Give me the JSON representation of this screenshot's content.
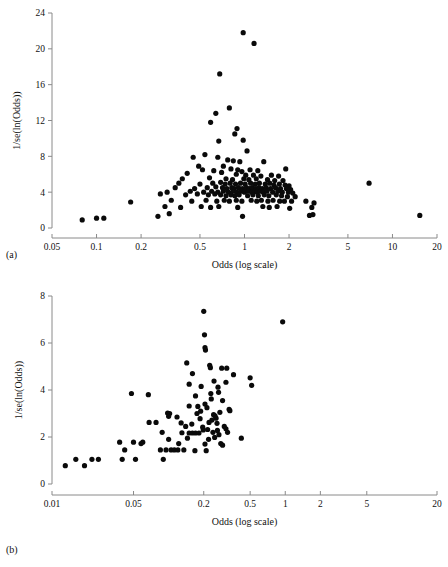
{
  "figure": {
    "panel_a_label": "(a)",
    "panel_b_label": "(b)",
    "point_color": "#0a0a0a",
    "axis_color": "#8a8a8a"
  },
  "chart_data": [
    {
      "type": "scatter",
      "panel": "(a)",
      "title": "",
      "xlabel": "Odds (log scale)",
      "ylabel": "1/se(ln(Odds))",
      "xscale": "log",
      "xlim": [
        0.05,
        20
      ],
      "ylim": [
        0,
        24
      ],
      "xticks": [
        0.05,
        0.1,
        0.2,
        0.5,
        1,
        2,
        5,
        10,
        20
      ],
      "xticklabels": [
        "0.05",
        "0.1",
        "0.2",
        "0.5",
        "1",
        "2",
        "5",
        "10",
        "20"
      ],
      "yticks": [
        0,
        4,
        8,
        12,
        16,
        20,
        24
      ],
      "yticklabels": [
        "0",
        "4",
        "8",
        "12",
        "16",
        "20",
        "24"
      ],
      "grid": false,
      "legend": "none",
      "n_points": 163,
      "points": [
        [
          0.98,
          21.8
        ],
        [
          1.16,
          20.6
        ],
        [
          0.68,
          17.2
        ],
        [
          0.79,
          13.4
        ],
        [
          0.64,
          12.8
        ],
        [
          0.59,
          11.8
        ],
        [
          0.89,
          11.1
        ],
        [
          0.86,
          10.5
        ],
        [
          0.67,
          9.7
        ],
        [
          0.98,
          9.8
        ],
        [
          0.54,
          8.2
        ],
        [
          1.04,
          8.6
        ],
        [
          0.45,
          7.9
        ],
        [
          0.66,
          7.9
        ],
        [
          0.77,
          7.6
        ],
        [
          0.84,
          7.5
        ],
        [
          0.93,
          7.4
        ],
        [
          1.35,
          7.4
        ],
        [
          0.49,
          6.9
        ],
        [
          0.52,
          6.5
        ],
        [
          0.72,
          6.9
        ],
        [
          0.81,
          6.6
        ],
        [
          0.9,
          6.5
        ],
        [
          0.96,
          6.3
        ],
        [
          1.09,
          6.5
        ],
        [
          1.23,
          6.4
        ],
        [
          1.9,
          6.6
        ],
        [
          0.41,
          6.1
        ],
        [
          0.62,
          6.4
        ],
        [
          0.7,
          6.2
        ],
        [
          0.88,
          6.0
        ],
        [
          1.02,
          5.9
        ],
        [
          1.15,
          5.9
        ],
        [
          1.29,
          5.8
        ],
        [
          1.52,
          5.9
        ],
        [
          1.7,
          5.8
        ],
        [
          0.38,
          5.5
        ],
        [
          0.58,
          5.6
        ],
        [
          0.75,
          5.5
        ],
        [
          0.83,
          5.4
        ],
        [
          0.99,
          5.5
        ],
        [
          1.07,
          5.4
        ],
        [
          1.2,
          5.5
        ],
        [
          1.43,
          5.4
        ],
        [
          1.6,
          5.3
        ],
        [
          1.82,
          5.3
        ],
        [
          6.95,
          5.0
        ],
        [
          0.36,
          5.0
        ],
        [
          0.5,
          4.9
        ],
        [
          0.61,
          5.0
        ],
        [
          0.69,
          5.1
        ],
        [
          0.74,
          4.9
        ],
        [
          0.8,
          5.0
        ],
        [
          0.87,
          4.9
        ],
        [
          0.94,
          5.0
        ],
        [
          1.01,
          4.9
        ],
        [
          1.1,
          5.0
        ],
        [
          1.18,
          4.9
        ],
        [
          1.26,
          5.0
        ],
        [
          1.38,
          4.9
        ],
        [
          1.48,
          5.0
        ],
        [
          1.58,
          4.8
        ],
        [
          1.72,
          4.9
        ],
        [
          1.88,
          4.8
        ],
        [
          2.0,
          4.7
        ],
        [
          0.34,
          4.5
        ],
        [
          0.46,
          4.4
        ],
        [
          0.56,
          4.5
        ],
        [
          0.64,
          4.6
        ],
        [
          0.71,
          4.5
        ],
        [
          0.76,
          4.4
        ],
        [
          0.82,
          4.5
        ],
        [
          0.85,
          4.4
        ],
        [
          0.91,
          4.5
        ],
        [
          0.97,
          4.4
        ],
        [
          1.03,
          4.5
        ],
        [
          1.08,
          4.4
        ],
        [
          1.13,
          4.5
        ],
        [
          1.19,
          4.4
        ],
        [
          1.25,
          4.5
        ],
        [
          1.32,
          4.4
        ],
        [
          1.4,
          4.5
        ],
        [
          1.5,
          4.4
        ],
        [
          1.62,
          4.5
        ],
        [
          1.75,
          4.4
        ],
        [
          1.92,
          4.4
        ],
        [
          2.05,
          4.3
        ],
        [
          0.3,
          4.0
        ],
        [
          0.43,
          4.1
        ],
        [
          0.53,
          4.0
        ],
        [
          0.6,
          4.1
        ],
        [
          0.66,
          4.0
        ],
        [
          0.72,
          4.1
        ],
        [
          0.78,
          4.0
        ],
        [
          0.84,
          4.1
        ],
        [
          0.89,
          4.0
        ],
        [
          0.95,
          4.1
        ],
        [
          1.0,
          4.0
        ],
        [
          1.06,
          4.1
        ],
        [
          1.12,
          4.0
        ],
        [
          1.17,
          4.1
        ],
        [
          1.22,
          4.0
        ],
        [
          1.28,
          4.1
        ],
        [
          1.34,
          4.0
        ],
        [
          1.42,
          4.1
        ],
        [
          1.55,
          4.0
        ],
        [
          1.68,
          4.1
        ],
        [
          1.8,
          4.0
        ],
        [
          1.98,
          4.0
        ],
        [
          2.12,
          3.9
        ],
        [
          0.27,
          3.8
        ],
        [
          0.4,
          3.7
        ],
        [
          0.48,
          3.8
        ],
        [
          0.57,
          3.7
        ],
        [
          0.63,
          3.8
        ],
        [
          0.69,
          3.7
        ],
        [
          0.75,
          3.6
        ],
        [
          0.81,
          3.7
        ],
        [
          0.86,
          3.6
        ],
        [
          0.92,
          3.7
        ],
        [
          1.05,
          3.6
        ],
        [
          1.14,
          3.7
        ],
        [
          1.24,
          3.6
        ],
        [
          1.36,
          3.7
        ],
        [
          1.46,
          3.6
        ],
        [
          1.64,
          3.7
        ],
        [
          1.78,
          3.6
        ],
        [
          1.95,
          3.5
        ],
        [
          2.2,
          3.5
        ],
        [
          0.17,
          2.9
        ],
        [
          0.32,
          3.1
        ],
        [
          0.44,
          3.0
        ],
        [
          0.55,
          3.1
        ],
        [
          0.65,
          3.0
        ],
        [
          0.73,
          3.1
        ],
        [
          0.79,
          3.0
        ],
        [
          0.88,
          3.1
        ],
        [
          0.96,
          3.0
        ],
        [
          1.11,
          3.1
        ],
        [
          1.21,
          3.0
        ],
        [
          1.3,
          3.1
        ],
        [
          1.44,
          3.0
        ],
        [
          1.56,
          3.1
        ],
        [
          1.73,
          3.0
        ],
        [
          1.86,
          3.0
        ],
        [
          2.08,
          3.0
        ],
        [
          2.6,
          3.0
        ],
        [
          2.95,
          2.8
        ],
        [
          0.29,
          2.4
        ],
        [
          0.37,
          2.3
        ],
        [
          0.51,
          2.4
        ],
        [
          0.59,
          2.3
        ],
        [
          0.67,
          2.4
        ],
        [
          0.9,
          2.3
        ],
        [
          1.33,
          2.4
        ],
        [
          1.47,
          2.3
        ],
        [
          1.66,
          2.4
        ],
        [
          2.02,
          2.2
        ],
        [
          2.85,
          2.3
        ],
        [
          0.26,
          1.3
        ],
        [
          0.31,
          1.6
        ],
        [
          0.97,
          1.3
        ],
        [
          2.75,
          1.4
        ],
        [
          2.9,
          1.5
        ],
        [
          0.08,
          0.9
        ],
        [
          0.1,
          1.1
        ],
        [
          0.112,
          1.1
        ],
        [
          15.3,
          1.4
        ]
      ]
    },
    {
      "type": "scatter",
      "panel": "(b)",
      "title": "",
      "xlabel": "Odds (log scale)",
      "ylabel": "1/se(ln(Odds))",
      "xscale": "log",
      "xlim": [
        0.01,
        20
      ],
      "ylim": [
        0,
        8
      ],
      "xticks": [
        0.01,
        0.05,
        0.2,
        0.5,
        1,
        2,
        5,
        20
      ],
      "xticklabels": [
        "0.01",
        "0.05",
        "0.2",
        "0.5",
        "1",
        "2",
        "5",
        "20"
      ],
      "yticks": [
        0,
        2,
        4,
        6,
        8
      ],
      "yticklabels": [
        "0",
        "2",
        "4",
        "6",
        "8"
      ],
      "grid": false,
      "legend": "none",
      "n_points": 96,
      "points": [
        [
          0.2,
          7.35
        ],
        [
          0.95,
          6.9
        ],
        [
          0.203,
          6.35
        ],
        [
          0.205,
          5.8
        ],
        [
          0.207,
          5.7
        ],
        [
          0.143,
          5.15
        ],
        [
          0.225,
          5.05
        ],
        [
          0.228,
          4.95
        ],
        [
          0.285,
          4.93
        ],
        [
          0.315,
          4.93
        ],
        [
          0.16,
          4.7
        ],
        [
          0.36,
          4.65
        ],
        [
          0.5,
          4.52
        ],
        [
          0.245,
          4.38
        ],
        [
          0.31,
          4.33
        ],
        [
          0.15,
          4.25
        ],
        [
          0.19,
          4.15
        ],
        [
          0.265,
          4.12
        ],
        [
          0.515,
          4.2
        ],
        [
          0.048,
          3.85
        ],
        [
          0.067,
          3.8
        ],
        [
          0.23,
          3.85
        ],
        [
          0.17,
          3.75
        ],
        [
          0.29,
          3.55
        ],
        [
          0.205,
          3.4
        ],
        [
          0.15,
          3.32
        ],
        [
          0.178,
          3.3
        ],
        [
          0.213,
          3.25
        ],
        [
          0.33,
          3.18
        ],
        [
          0.335,
          3.12
        ],
        [
          0.098,
          3.02
        ],
        [
          0.102,
          3.0
        ],
        [
          0.175,
          3.0
        ],
        [
          0.243,
          2.95
        ],
        [
          0.1,
          2.88
        ],
        [
          0.118,
          2.85
        ],
        [
          0.25,
          2.9
        ],
        [
          0.255,
          2.8
        ],
        [
          0.186,
          2.78
        ],
        [
          0.235,
          2.72
        ],
        [
          0.068,
          2.62
        ],
        [
          0.078,
          2.62
        ],
        [
          0.128,
          2.6
        ],
        [
          0.26,
          2.58
        ],
        [
          0.3,
          2.45
        ],
        [
          0.196,
          2.42
        ],
        [
          0.31,
          2.35
        ],
        [
          0.088,
          2.2
        ],
        [
          0.13,
          2.18
        ],
        [
          0.15,
          2.17
        ],
        [
          0.16,
          2.17
        ],
        [
          0.17,
          2.17
        ],
        [
          0.182,
          2.17
        ],
        [
          0.24,
          2.2
        ],
        [
          0.32,
          2.2
        ],
        [
          0.27,
          2.1
        ],
        [
          0.42,
          1.95
        ],
        [
          0.22,
          1.9
        ],
        [
          0.038,
          1.78
        ],
        [
          0.05,
          1.78
        ],
        [
          0.06,
          1.78
        ],
        [
          0.1,
          1.9
        ],
        [
          0.058,
          1.72
        ],
        [
          0.122,
          1.72
        ],
        [
          0.205,
          1.7
        ],
        [
          0.28,
          1.72
        ],
        [
          0.29,
          1.65
        ],
        [
          0.042,
          1.45
        ],
        [
          0.085,
          1.45
        ],
        [
          0.095,
          1.45
        ],
        [
          0.105,
          1.45
        ],
        [
          0.112,
          1.45
        ],
        [
          0.12,
          1.45
        ],
        [
          0.135,
          1.45
        ],
        [
          0.168,
          1.42
        ],
        [
          0.21,
          1.42
        ],
        [
          0.04,
          1.05
        ],
        [
          0.052,
          1.05
        ],
        [
          0.09,
          1.05
        ],
        [
          0.016,
          1.05
        ],
        [
          0.022,
          1.05
        ],
        [
          0.025,
          1.05
        ],
        [
          0.013,
          0.78
        ],
        [
          0.019,
          0.78
        ],
        [
          0.14,
          2.45
        ],
        [
          0.158,
          2.55
        ],
        [
          0.198,
          2.3
        ],
        [
          0.216,
          2.32
        ],
        [
          0.262,
          2.28
        ],
        [
          0.275,
          3.05
        ],
        [
          0.188,
          3.1
        ],
        [
          0.222,
          2.62
        ],
        [
          0.145,
          1.95
        ],
        [
          0.248,
          1.98
        ],
        [
          0.232,
          3.62
        ],
        [
          0.268,
          3.9
        ]
      ]
    }
  ]
}
